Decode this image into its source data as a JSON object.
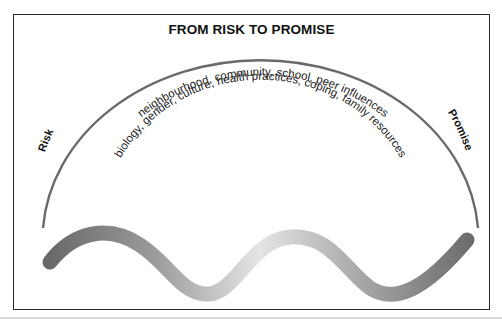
{
  "diagram": {
    "title": "FROM RISK TO PROMISE",
    "left_label": "Risk",
    "right_label": "Promise",
    "outer_arc_text": "neighbourhood, community, school, peer influences",
    "inner_arc_text": "biology, gender, culture, health practices, coping, family resources",
    "colors": {
      "frame": "#2a2a2a",
      "arc": "#6a6a6a",
      "wave_dark": "#6b6b6b",
      "wave_light": "#e6e6e6",
      "text": "#222222"
    }
  }
}
